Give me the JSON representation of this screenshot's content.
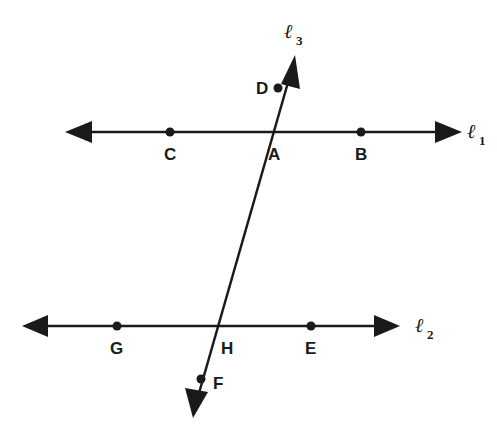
{
  "diagram": {
    "color": "#1a1a1a",
    "lines": [
      {
        "id": "l1",
        "name": "ℓ",
        "subscript": "1",
        "points_on": [
          "C",
          "A",
          "B"
        ]
      },
      {
        "id": "l2",
        "name": "ℓ",
        "subscript": "2",
        "points_on": [
          "G",
          "H",
          "E"
        ]
      },
      {
        "id": "l3",
        "name": "ℓ",
        "subscript": "3",
        "points_on": [
          "D",
          "A",
          "H",
          "F"
        ]
      }
    ],
    "points": {
      "A": "A",
      "B": "B",
      "C": "C",
      "D": "D",
      "E": "E",
      "F": "F",
      "G": "G",
      "H": "H"
    }
  }
}
